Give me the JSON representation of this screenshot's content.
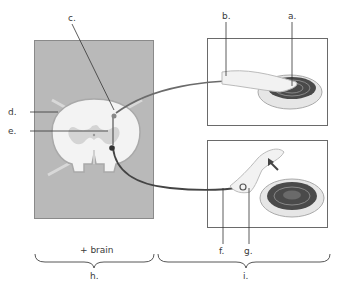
{
  "labels": {
    "a": "a.",
    "b": "b.",
    "c": "c.",
    "d": "d.",
    "e": "e.",
    "f": "f.",
    "g": "g.",
    "h": "h.",
    "i": "i."
  },
  "brace_captions": {
    "left_top": "+ brain"
  },
  "colors": {
    "cord_background": "#b9b9b9",
    "gray_matter": "#d4d4d4",
    "white_matter": "#f2f2f2",
    "neuron_path": "#6b6b6b",
    "leader_line": "#333333",
    "panel_border": "#6a6a6a"
  }
}
